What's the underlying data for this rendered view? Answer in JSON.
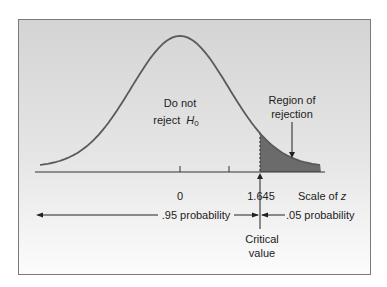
{
  "chart_data": {
    "type": "area",
    "title": "",
    "distribution": "standard normal",
    "xlabel": "Scale of z",
    "ylabel": "",
    "x_ticks": [
      {
        "value": 0,
        "label": "0"
      },
      {
        "value": 1,
        "label": ""
      },
      {
        "value": 1.645,
        "label": "1.645"
      }
    ],
    "regions": [
      {
        "name": "acceptance",
        "label_line1": "Do not",
        "label_line2": "reject",
        "hypothesis": "H",
        "subscript": "0",
        "range": [
          -3,
          1.645
        ],
        "probability": 0.95,
        "shaded": false
      },
      {
        "name": "rejection",
        "label_line1": "Region of",
        "label_line2": "rejection",
        "range": [
          1.645,
          3
        ],
        "probability": 0.05,
        "shaded": true
      }
    ],
    "critical_value": 1.645,
    "critical_label_line1": "Critical",
    "critical_label_line2": "value",
    "annotations": [
      {
        "text": ".95 probability",
        "side": "left of critical value"
      },
      {
        "text": ".05 probability",
        "side": "right of critical value"
      }
    ],
    "grid": false,
    "legend": "none",
    "colors": {
      "curve": "#5a5a5a",
      "rejection_fill": "#6b6b6b",
      "background_top": "#d6d6d6",
      "background_bottom": "#fbfbfb",
      "frame": "#777777"
    }
  },
  "labels": {
    "do_not": "Do not",
    "reject": "reject",
    "h": "H",
    "h_sub": "0",
    "region_of": "Region of",
    "rejection": "rejection",
    "tick_zero": "0",
    "tick_crit": "1.645",
    "scale_of": "Scale of ",
    "z": "z",
    "p95": ".95 probability",
    "p05": ".05 probability",
    "critical": "Critical",
    "value": "value"
  }
}
